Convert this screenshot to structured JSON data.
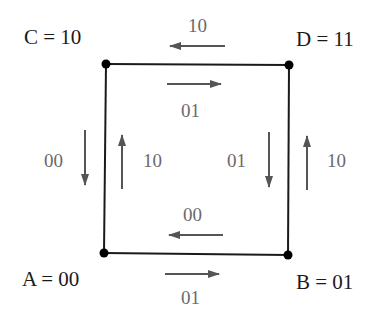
{
  "diagram": {
    "type": "state-transition-square",
    "colors": {
      "edge": "#1a1a1a",
      "node": "#000000",
      "arrow": "#555555",
      "node_label": "#1a1a1a",
      "edge_label": "#6a6a6a"
    },
    "nodes": [
      {
        "id": "C",
        "label": "C = 10",
        "x": 106,
        "y": 64
      },
      {
        "id": "D",
        "label": "D = 11",
        "x": 289,
        "y": 65
      },
      {
        "id": "A",
        "label": "A = 00",
        "x": 104,
        "y": 253
      },
      {
        "id": "B",
        "label": "B = 01",
        "x": 288,
        "y": 255
      }
    ],
    "edges": [
      {
        "from": "C",
        "to": "D"
      },
      {
        "from": "D",
        "to": "B"
      },
      {
        "from": "B",
        "to": "A"
      },
      {
        "from": "A",
        "to": "C"
      }
    ],
    "transitions": [
      {
        "id": "d-to-c",
        "from": "D",
        "to": "C",
        "label": "10",
        "direction": "left"
      },
      {
        "id": "c-to-d",
        "from": "C",
        "to": "D",
        "label": "01",
        "direction": "right"
      },
      {
        "id": "b-to-a",
        "from": "B",
        "to": "A",
        "label": "00",
        "direction": "left"
      },
      {
        "id": "a-to-b",
        "from": "A",
        "to": "B",
        "label": "01",
        "direction": "right"
      },
      {
        "id": "c-to-a",
        "from": "C",
        "to": "A",
        "label": "00",
        "direction": "down"
      },
      {
        "id": "a-to-c",
        "from": "A",
        "to": "C",
        "label": "10",
        "direction": "up"
      },
      {
        "id": "d-to-b",
        "from": "D",
        "to": "B",
        "label": "01",
        "direction": "down"
      },
      {
        "id": "b-to-d",
        "from": "B",
        "to": "D",
        "label": "10",
        "direction": "up"
      }
    ]
  }
}
